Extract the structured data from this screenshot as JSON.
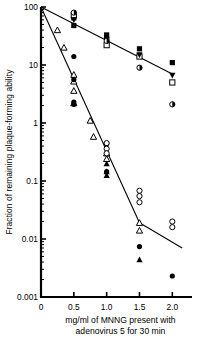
{
  "chart_data": {
    "type": "scatter",
    "title": "",
    "xlabel": "mg/ml of MNNG present with adenovirus 5 for 30 min",
    "xlabel_line1": "mg/ml of MNNG present with",
    "xlabel_line2": "adenovirus 5 for 30 min",
    "ylabel": "Fraction of remaining plaque-forming ability",
    "xlim": [
      0,
      2.3
    ],
    "ylim": [
      0.001,
      100
    ],
    "yscale": "log",
    "grid": false,
    "legend": "none",
    "xticks": [
      0,
      0.5,
      1.0,
      1.5,
      2.0
    ],
    "xticklabels": [
      "0",
      "0.5",
      "1.0",
      "1.5",
      "2.0"
    ],
    "yticks": [
      100,
      10,
      1,
      0.1,
      0.01,
      0.001
    ],
    "yticklabels": [
      "100",
      "10",
      "1",
      "0.1",
      "0.01",
      "0.001"
    ],
    "series": [
      {
        "name": "resistant-line",
        "type": "line",
        "x": [
          0.0,
          2.0
        ],
        "y": [
          100,
          7.0
        ]
      },
      {
        "name": "sensitive-line",
        "type": "line",
        "x": [
          0.0,
          1.5
        ],
        "y": [
          100,
          0.019
        ]
      },
      {
        "name": "sensitive-line-tail",
        "type": "line",
        "x": [
          1.5,
          2.15
        ],
        "y": [
          0.019,
          0.007
        ]
      },
      {
        "name": "filled-square",
        "marker": "filled-square",
        "points": [
          {
            "x": 0.5,
            "y": 65
          },
          {
            "x": 0.5,
            "y": 48
          },
          {
            "x": 1.0,
            "y": 33
          },
          {
            "x": 1.0,
            "y": 28
          },
          {
            "x": 1.5,
            "y": 19
          },
          {
            "x": 2.0,
            "y": 11
          }
        ]
      },
      {
        "name": "open-square",
        "marker": "open-square",
        "points": [
          {
            "x": 0.5,
            "y": 72
          },
          {
            "x": 1.0,
            "y": 22
          },
          {
            "x": 1.5,
            "y": 14
          },
          {
            "x": 2.0,
            "y": 5.0
          }
        ]
      },
      {
        "name": "filled-triangle-down",
        "marker": "filled-triangle-down",
        "points": [
          {
            "x": 0.5,
            "y": 60
          },
          {
            "x": 1.0,
            "y": 27
          },
          {
            "x": 1.5,
            "y": 15
          },
          {
            "x": 2.0,
            "y": 6.6
          }
        ]
      },
      {
        "name": "half-filled-circle",
        "marker": "half-filled-circle",
        "points": [
          {
            "x": 0.5,
            "y": 80
          },
          {
            "x": 1.0,
            "y": 26
          },
          {
            "x": 1.5,
            "y": 9.0
          },
          {
            "x": 2.0,
            "y": 2.1
          }
        ]
      },
      {
        "name": "open-triangle",
        "marker": "open-triangle",
        "points": [
          {
            "x": 0.25,
            "y": 40
          },
          {
            "x": 0.35,
            "y": 20
          },
          {
            "x": 0.5,
            "y": 6.8
          },
          {
            "x": 0.5,
            "y": 5.2
          },
          {
            "x": 0.5,
            "y": 3.6
          },
          {
            "x": 0.5,
            "y": 2.2
          },
          {
            "x": 0.75,
            "y": 1.1
          },
          {
            "x": 0.8,
            "y": 0.58
          },
          {
            "x": 1.0,
            "y": 0.3
          },
          {
            "x": 1.0,
            "y": 0.24
          },
          {
            "x": 1.5,
            "y": 0.019
          },
          {
            "x": 1.5,
            "y": 0.014
          }
        ]
      },
      {
        "name": "filled-triangle",
        "marker": "filled-triangle",
        "points": [
          {
            "x": 1.0,
            "y": 0.2
          },
          {
            "x": 1.0,
            "y": 0.145
          },
          {
            "x": 1.0,
            "y": 0.125
          },
          {
            "x": 1.5,
            "y": 0.0044
          }
        ]
      },
      {
        "name": "filled-circle",
        "marker": "filled-circle",
        "points": [
          {
            "x": 0.5,
            "y": 14
          },
          {
            "x": 0.5,
            "y": 5.6
          },
          {
            "x": 0.5,
            "y": 2.3
          },
          {
            "x": 0.5,
            "y": 2.1
          },
          {
            "x": 1.0,
            "y": 0.44
          },
          {
            "x": 1.0,
            "y": 0.145
          },
          {
            "x": 1.5,
            "y": 0.0074
          },
          {
            "x": 2.0,
            "y": 0.0023
          }
        ]
      },
      {
        "name": "open-circle",
        "marker": "open-circle",
        "points": [
          {
            "x": 1.0,
            "y": 0.45
          },
          {
            "x": 1.0,
            "y": 0.36
          },
          {
            "x": 1.0,
            "y": 0.3
          },
          {
            "x": 1.5,
            "y": 0.068
          },
          {
            "x": 1.5,
            "y": 0.055
          },
          {
            "x": 1.5,
            "y": 0.043
          },
          {
            "x": 2.0,
            "y": 0.02
          },
          {
            "x": 2.0,
            "y": 0.016
          }
        ]
      }
    ]
  }
}
